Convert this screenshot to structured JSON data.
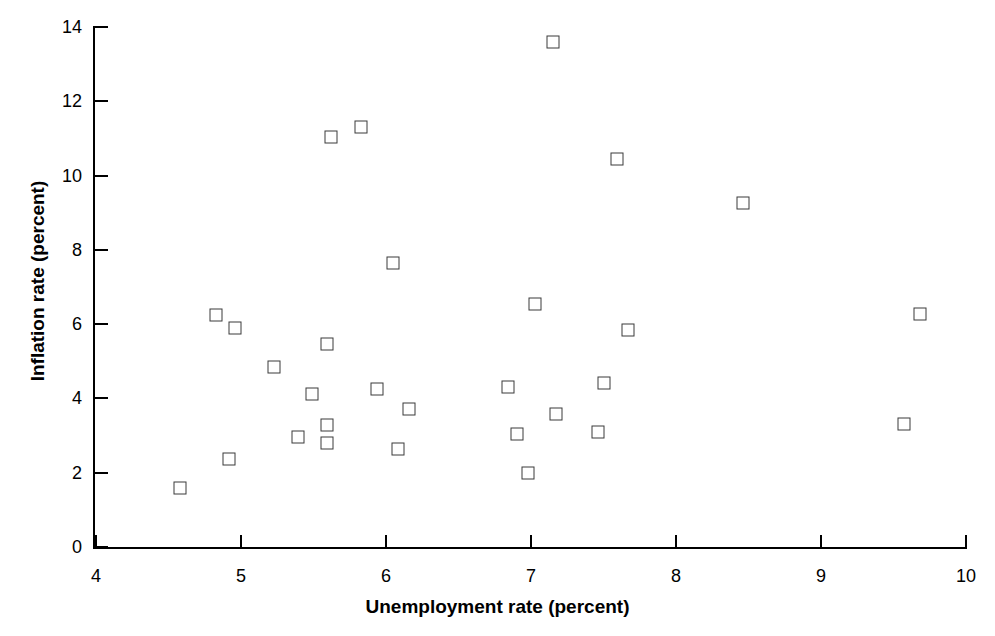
{
  "chart_data": {
    "type": "scatter",
    "title": "",
    "xlabel": "Unemployment rate (percent)",
    "ylabel": "Inflation rate (percent)",
    "xlim": [
      4,
      10
    ],
    "ylim": [
      0,
      14
    ],
    "xticks": [
      4,
      5,
      6,
      7,
      8,
      9,
      10
    ],
    "xtick_labels": [
      "4",
      "5",
      "6",
      "7",
      "8",
      "9",
      "10"
    ],
    "yticks": [
      0,
      2,
      4,
      6,
      8,
      10,
      12,
      14
    ],
    "ytick_labels": [
      "0",
      "2",
      "4",
      "6",
      "8",
      "10",
      "12",
      "14"
    ],
    "grid": false,
    "legend": null,
    "marker": "open-square",
    "marker_color": "#3a3a3a",
    "points": [
      {
        "x": 4.58,
        "y": 1.59
      },
      {
        "x": 4.83,
        "y": 6.24
      },
      {
        "x": 4.92,
        "y": 2.37
      },
      {
        "x": 4.96,
        "y": 5.89
      },
      {
        "x": 5.23,
        "y": 4.85
      },
      {
        "x": 5.39,
        "y": 2.96
      },
      {
        "x": 5.49,
        "y": 4.12
      },
      {
        "x": 5.59,
        "y": 5.47
      },
      {
        "x": 5.59,
        "y": 3.29
      },
      {
        "x": 5.59,
        "y": 2.8
      },
      {
        "x": 5.62,
        "y": 11.04
      },
      {
        "x": 5.83,
        "y": 11.31
      },
      {
        "x": 5.94,
        "y": 4.25
      },
      {
        "x": 6.05,
        "y": 7.65
      },
      {
        "x": 6.08,
        "y": 2.64
      },
      {
        "x": 6.16,
        "y": 3.72
      },
      {
        "x": 6.84,
        "y": 4.31
      },
      {
        "x": 6.9,
        "y": 3.04
      },
      {
        "x": 6.98,
        "y": 1.99
      },
      {
        "x": 7.03,
        "y": 6.54
      },
      {
        "x": 7.15,
        "y": 13.6
      },
      {
        "x": 7.17,
        "y": 3.58
      },
      {
        "x": 7.46,
        "y": 3.1
      },
      {
        "x": 7.5,
        "y": 4.41
      },
      {
        "x": 7.59,
        "y": 10.44
      },
      {
        "x": 7.67,
        "y": 5.84
      },
      {
        "x": 8.46,
        "y": 9.26
      },
      {
        "x": 9.57,
        "y": 3.31
      },
      {
        "x": 9.68,
        "y": 6.27
      }
    ]
  },
  "axes": {
    "x_title": "Unemployment rate (percent)",
    "y_title": "Inflation rate (percent)"
  }
}
